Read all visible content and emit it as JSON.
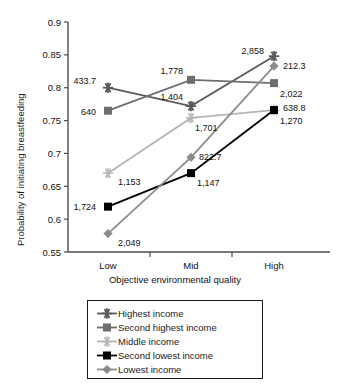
{
  "chart_data": {
    "type": "line",
    "title": "",
    "xlabel": "Objective environmental quality",
    "ylabel": "Probability of initiating breastfeeding",
    "categories": [
      "Low",
      "Mid",
      "High"
    ],
    "ylim": [
      0.55,
      0.9
    ],
    "yticks": [
      "0.55",
      "0.6",
      "0.65",
      "0.7",
      "0.75",
      "0.8",
      "0.85",
      "0.9"
    ],
    "ytick_values": [
      0.55,
      0.6,
      0.65,
      0.7,
      0.75,
      0.8,
      0.85,
      0.9
    ],
    "grid": false,
    "legend_position": "bottom",
    "series": [
      {
        "name": "Highest income",
        "marker": "asterisk",
        "color": "#595959",
        "values": [
          0.8,
          0.772,
          0.848
        ],
        "point_labels": [
          "433.7",
          "1,404",
          "2,858"
        ]
      },
      {
        "name": "Second highest income",
        "marker": "square",
        "color": "#6e6e6e",
        "values": [
          0.765,
          0.812,
          0.807
        ],
        "point_labels": [
          "640",
          "1,778",
          "2,022"
        ]
      },
      {
        "name": "Middle income",
        "marker": "star",
        "color": "#b5b5b5",
        "values": [
          0.67,
          0.754,
          0.766
        ],
        "point_labels": [
          "1,153",
          "1,701",
          "1,270"
        ]
      },
      {
        "name": "Second lowest income",
        "marker": "square",
        "color": "#000000",
        "values": [
          0.619,
          0.67,
          0.766
        ],
        "point_labels": [
          "1,724",
          "1,147",
          "638.8"
        ]
      },
      {
        "name": "Lowest income",
        "marker": "diamond",
        "color": "#8c8c8c",
        "values": [
          0.578,
          0.694,
          0.833
        ],
        "point_labels": [
          "2,049",
          "822.7",
          "212.3"
        ]
      }
    ]
  },
  "legend": {
    "items": [
      "Highest income",
      "Second highest income",
      "Middle income",
      "Second lowest income",
      "Lowest income"
    ]
  },
  "axes": {
    "y_title": "Probability of initiating breastfeeding",
    "x_title": "Objective environmental quality"
  }
}
